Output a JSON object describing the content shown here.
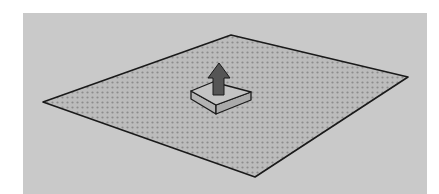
{
  "scene": {
    "description": "Push/Pull tool illustration: a flat rectangular face drawn in perspective with a small raised box and an upward arrow",
    "colors": {
      "background": "#c9c9c9",
      "face_fill": "#bcbcbc",
      "face_dots": "#8c8c8c",
      "edge": "#1a1a1a",
      "box_top": "#c4c4c4",
      "box_side": "#b3b3b3",
      "arrow": "#555555"
    },
    "face_points": "43,102 231,35 408,77 255,177",
    "box": {
      "top_points": "191,91 213,82 251,92 216,105",
      "left_side_points": "191,91 216,105 216,114 191,99",
      "right_side_points": "216,105 251,92 251,100 216,114"
    },
    "arrow": {
      "points": "219,63 230,78 224,78 224,95 213,95 213,78 208,78"
    },
    "icons": [
      "push-pull-arrow-icon"
    ]
  }
}
